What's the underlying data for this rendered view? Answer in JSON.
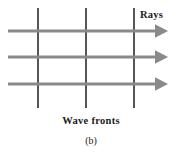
{
  "figure": {
    "caption": "(b)",
    "width": 182,
    "height": 155,
    "background_color": "#ffffff"
  },
  "labels": {
    "rays": "Rays",
    "wave_fronts": "Wave fronts",
    "subfigure": "(b)"
  },
  "diagram_data": {
    "type": "physics-wave-diagram",
    "description": "Plane wave fronts shown as vertical lines with horizontal rays (arrows) pointing to the right, perpendicular to the wave fronts.",
    "ray_color": "#8a8a8a",
    "wavefront_color": "#555555",
    "rays": [
      {
        "name": "ray-top",
        "x_start": 8,
        "x_end": 168,
        "y": 31,
        "direction": "right"
      },
      {
        "name": "ray-middle",
        "x_start": 8,
        "x_end": 168,
        "y": 57,
        "direction": "right"
      },
      {
        "name": "ray-bottom",
        "x_start": 8,
        "x_end": 168,
        "y": 84,
        "direction": "right"
      }
    ],
    "wave_fronts": [
      {
        "name": "wavefront-1",
        "x": 38,
        "y_start": 8,
        "y_end": 108
      },
      {
        "name": "wavefront-2",
        "x": 86,
        "y_start": 8,
        "y_end": 108
      },
      {
        "name": "wavefront-3",
        "x": 134,
        "y_start": 8,
        "y_end": 108
      }
    ],
    "ray_stroke_width": 3.2,
    "wavefront_stroke_width": 1.1,
    "arrow_head_length": 9,
    "arrow_head_width": 9
  }
}
